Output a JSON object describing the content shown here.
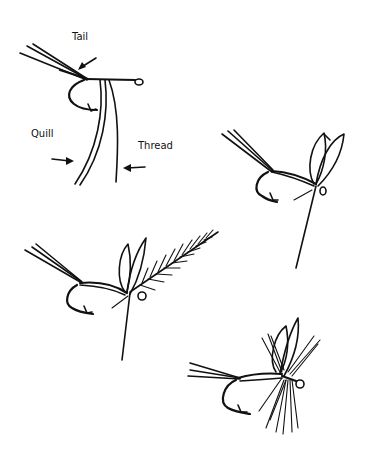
{
  "figure": {
    "ink_color": "#111111",
    "background": "#ffffff",
    "steps": [
      {
        "id": 1,
        "description": "Hook with tail, quill and thread tied in"
      },
      {
        "id": 2,
        "description": "Wings added"
      },
      {
        "id": 3,
        "description": "Hackle feather tied in"
      },
      {
        "id": 4,
        "description": "Hackle wound, finished fly"
      }
    ],
    "labels": {
      "tail": "Tail",
      "quill": "Quill",
      "thread": "Thread"
    }
  }
}
